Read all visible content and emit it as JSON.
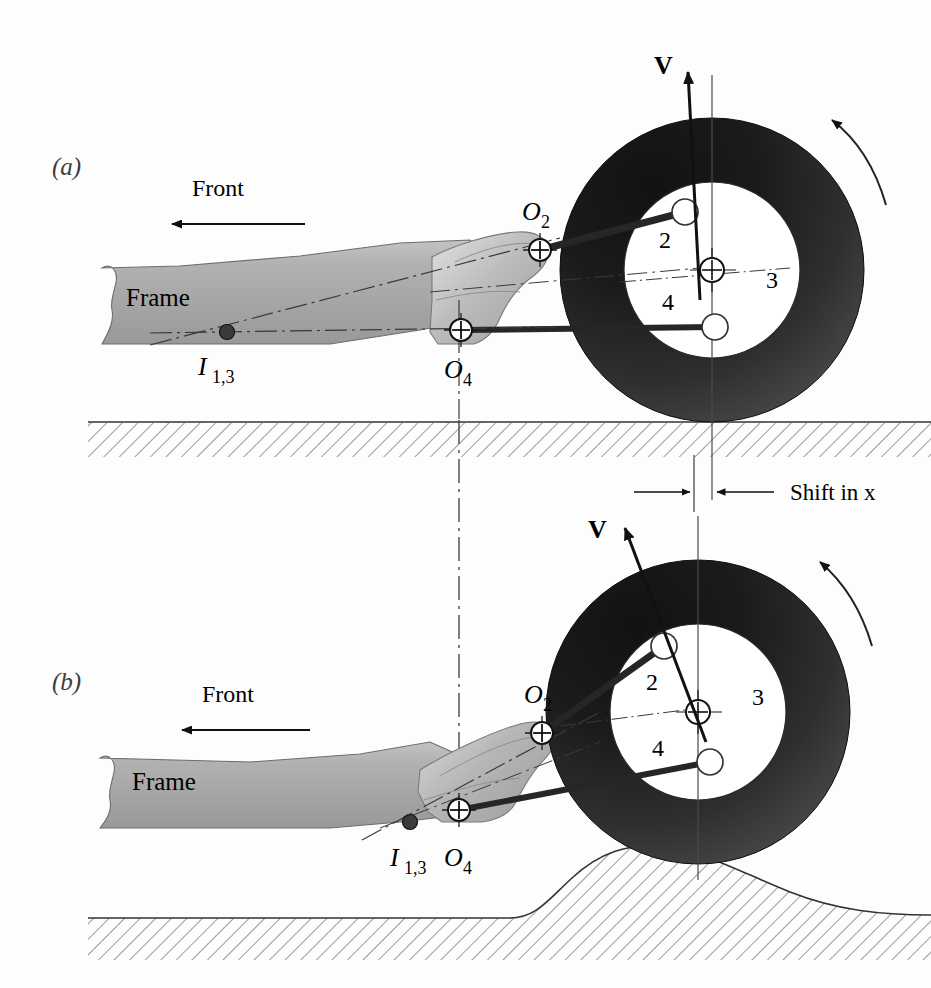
{
  "figure": {
    "panels": [
      {
        "id": "a",
        "label": "(a)",
        "condition": "level ground",
        "annotations": {
          "direction_label": "Front",
          "frame_label": "Frame",
          "instant_center_label": "I",
          "instant_center_sub": "1,3",
          "pivot_upper_label": "O",
          "pivot_upper_sub": "2",
          "pivot_lower_label": "O",
          "pivot_lower_sub": "4",
          "velocity_label": "V",
          "link_numbers": [
            "2",
            "3",
            "4"
          ]
        }
      },
      {
        "id": "b",
        "label": "(b)",
        "condition": "wheel over bump",
        "annotations": {
          "direction_label": "Front",
          "frame_label": "Frame",
          "instant_center_label": "I",
          "instant_center_sub": "1,3",
          "pivot_upper_label": "O",
          "pivot_upper_sub": "2",
          "pivot_lower_label": "O",
          "pivot_lower_sub": "4",
          "velocity_label": "V",
          "link_numbers": [
            "2",
            "3",
            "4"
          ]
        }
      }
    ],
    "dimension": {
      "label_prefix": "Shift in ",
      "label_variable": "x",
      "full_label": "Shift in x"
    },
    "colors": {
      "tire_dark": "#1c1c1c",
      "tire_light": "#585858",
      "frame_gray": "#a9a9a9",
      "frame_light": "#d6d6d6",
      "knuckle_gray": "#b8b8b8",
      "line_black": "#1a1a1a",
      "hatch_gray": "#6e6e6e",
      "background": "#fdfdfd"
    }
  }
}
